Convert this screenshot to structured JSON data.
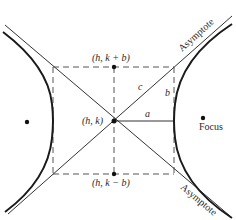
{
  "diagram": {
    "type": "hyperbola",
    "center": {
      "label": "(h, k)",
      "x": 114,
      "y": 121
    },
    "top_point": {
      "label": "(h, k + b)",
      "x": 114,
      "y": 67
    },
    "bottom_point": {
      "label": "(h, k − b)",
      "x": 114,
      "y": 174
    },
    "segments": {
      "a_label": "a",
      "b_label": "b",
      "c_label": "c"
    },
    "focus_label": "Focus",
    "asymptote_top_label": "Asymptote",
    "asymptote_bottom_label": "Asymptote",
    "colors": {
      "curve": "#1a1a1a",
      "line": "#333333",
      "dashed": "#555555",
      "background": "#ffffff"
    }
  }
}
